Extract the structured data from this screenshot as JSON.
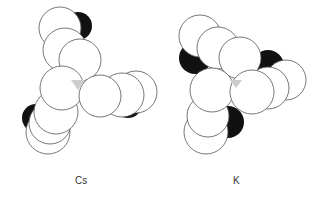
{
  "figure": {
    "background": "#ffffff",
    "stroke": "#555555",
    "shadow": "#111111",
    "center": "#cccccc",
    "molecules": [
      {
        "label": "Cs",
        "center_triangle": [
          [
            71,
            80
          ],
          [
            85,
            80
          ],
          [
            78,
            90
          ]
        ],
        "shadows": [
          {
            "cx": 78,
            "cy": 26,
            "r": 14
          },
          {
            "cx": 36,
            "cy": 118,
            "r": 14
          },
          {
            "cx": 128,
            "cy": 104,
            "r": 14
          }
        ],
        "atoms": [
          {
            "cx": 60,
            "cy": 28,
            "r": 21
          },
          {
            "cx": 65,
            "cy": 50,
            "r": 22
          },
          {
            "cx": 48,
            "cy": 132,
            "r": 22
          },
          {
            "cx": 50,
            "cy": 123,
            "r": 21
          },
          {
            "cx": 136,
            "cy": 92,
            "r": 21
          },
          {
            "cx": 122,
            "cy": 95,
            "r": 22
          },
          {
            "cx": 56,
            "cy": 112,
            "r": 22
          },
          {
            "cx": 80,
            "cy": 60,
            "r": 21
          },
          {
            "cx": 62,
            "cy": 88,
            "r": 22
          },
          {
            "cx": 100,
            "cy": 96,
            "r": 21
          }
        ]
      },
      {
        "label": "K",
        "center_triangle": [
          [
            230,
            80
          ],
          [
            242,
            80
          ],
          [
            236,
            88
          ]
        ],
        "shadows": [
          {
            "cx": 195,
            "cy": 58,
            "r": 16
          },
          {
            "cx": 268,
            "cy": 66,
            "r": 16
          },
          {
            "cx": 228,
            "cy": 122,
            "r": 16
          }
        ],
        "atoms": [
          {
            "cx": 200,
            "cy": 36,
            "r": 21
          },
          {
            "cx": 218,
            "cy": 48,
            "r": 21
          },
          {
            "cx": 286,
            "cy": 80,
            "r": 20
          },
          {
            "cx": 268,
            "cy": 88,
            "r": 21
          },
          {
            "cx": 206,
            "cy": 132,
            "r": 22
          },
          {
            "cx": 208,
            "cy": 116,
            "r": 21
          },
          {
            "cx": 240,
            "cy": 58,
            "r": 21
          },
          {
            "cx": 212,
            "cy": 90,
            "r": 22
          },
          {
            "cx": 252,
            "cy": 92,
            "r": 22
          }
        ]
      }
    ]
  },
  "labels": {
    "cs": "Cs",
    "k": "K"
  }
}
